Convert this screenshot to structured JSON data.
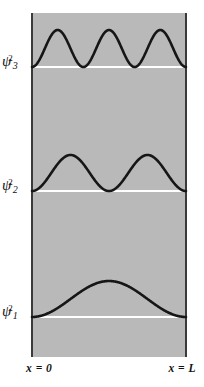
{
  "figure": {
    "background_color": "#ffffff",
    "plot_fill_color": "#b9b9b9",
    "wall_color": "#3a3a3a",
    "curve_color": "#161616",
    "baseline_color": "#ffffff"
  },
  "axis": {
    "left_label": "x = 0",
    "right_label": "x = L"
  },
  "labels": {
    "psi3": {
      "symbol": "ψ",
      "sub": "3",
      "sup": "2"
    },
    "psi2": {
      "symbol": "ψ",
      "sub": "2",
      "sup": "2"
    },
    "psi1": {
      "symbol": "ψ",
      "sub": "1",
      "sup": "2"
    }
  },
  "chart_data": {
    "type": "line",
    "xlabel": "x",
    "ylabel": "ψ²",
    "xlim": [
      0,
      1
    ],
    "x_tick_labels": [
      "x = 0",
      "x = L"
    ],
    "grid": false,
    "legend": "none",
    "function_form": "psi_n^2(x) = sin^2(n*pi*x/L)",
    "series": [
      {
        "name": "ψ3²",
        "quantum_number": 3,
        "nodes": 2,
        "peaks": 3,
        "baseline_y_px": 67,
        "amplitude_px": 37,
        "peak_positions_fraction": [
          0.1667,
          0.5,
          0.8333
        ],
        "node_positions_fraction": [
          0.0,
          0.3333,
          0.6667,
          1.0
        ]
      },
      {
        "name": "ψ2²",
        "quantum_number": 2,
        "nodes": 1,
        "peaks": 2,
        "baseline_y_px": 191,
        "amplitude_px": 36,
        "peak_positions_fraction": [
          0.25,
          0.75
        ],
        "node_positions_fraction": [
          0.0,
          0.5,
          1.0
        ]
      },
      {
        "name": "ψ1²",
        "quantum_number": 1,
        "nodes": 0,
        "peaks": 1,
        "baseline_y_px": 317,
        "amplitude_px": 36,
        "peak_positions_fraction": [
          0.5
        ],
        "node_positions_fraction": [
          0.0,
          1.0
        ]
      }
    ]
  }
}
